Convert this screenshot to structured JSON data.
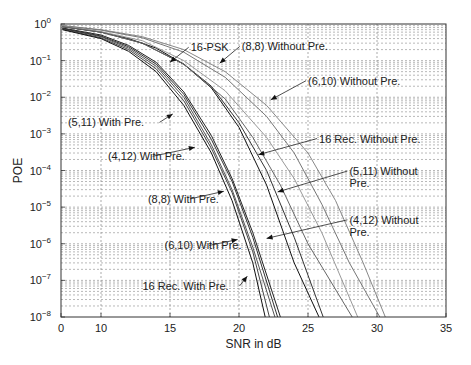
{
  "chart_data": {
    "type": "line",
    "title": "",
    "xlabel": "SNR in dB",
    "ylabel": "POE",
    "xlim": [
      0,
      35
    ],
    "x_ticks": [
      0,
      10,
      15,
      20,
      25,
      30,
      35
    ],
    "x_tick_labels": [
      "0",
      "10",
      "15",
      "20",
      "25",
      "30",
      "35"
    ],
    "yscale": "log",
    "ylim": [
      1e-08,
      1
    ],
    "y_ticks": [
      1,
      0.1,
      0.01,
      0.001,
      0.0001,
      1e-05,
      1e-06,
      1e-07,
      1e-08
    ],
    "y_tick_labels": [
      {
        "base": "10",
        "exp": "0"
      },
      {
        "base": "10",
        "exp": "−1"
      },
      {
        "base": "10",
        "exp": "−2"
      },
      {
        "base": "10",
        "exp": "−3"
      },
      {
        "base": "10",
        "exp": "−4"
      },
      {
        "base": "10",
        "exp": "−5"
      },
      {
        "base": "10",
        "exp": "−6"
      },
      {
        "base": "10",
        "exp": "−7"
      },
      {
        "base": "10",
        "exp": "−8"
      }
    ],
    "grid": true,
    "legend": "none",
    "series": [
      {
        "name": "16-PSK",
        "color": "#111111",
        "x": [
          7.2,
          10,
          12,
          14,
          16,
          18,
          20,
          22,
          24,
          25.8
        ],
        "y": [
          0.85,
          0.6,
          0.4,
          0.22,
          0.08,
          0.018,
          0.0015,
          4e-05,
          3e-07,
          1e-08
        ]
      },
      {
        "name": "(8,8) Without Pre.",
        "color": "#888888",
        "x": [
          7.2,
          10,
          13,
          16,
          19,
          22,
          25,
          27,
          29,
          30.6
        ],
        "y": [
          0.9,
          0.7,
          0.45,
          0.2,
          0.05,
          0.006,
          0.0003,
          1.5e-05,
          3e-07,
          1e-08
        ]
      },
      {
        "name": "(6,10) Without Pre.",
        "color": "#777777",
        "x": [
          7.2,
          10,
          13,
          16,
          19,
          22,
          24,
          26,
          28,
          30.2
        ],
        "y": [
          0.9,
          0.68,
          0.42,
          0.17,
          0.035,
          0.003,
          0.0003,
          1.2e-05,
          3e-07,
          1e-08
        ]
      },
      {
        "name": "16 Rec. Without Pre.",
        "color": "#333333",
        "x": [
          7.2,
          10,
          13,
          16,
          18,
          20,
          22,
          24,
          26.1
        ],
        "y": [
          0.85,
          0.6,
          0.3,
          0.08,
          0.02,
          0.002,
          0.0001,
          1.5e-06,
          1e-08
        ]
      },
      {
        "name": "(5,11) Without Pre.",
        "color": "#999999",
        "x": [
          7.2,
          10,
          13,
          16,
          19,
          22,
          24,
          26,
          28.6
        ],
        "y": [
          0.88,
          0.62,
          0.35,
          0.1,
          0.015,
          0.0008,
          6e-05,
          2e-06,
          1e-08
        ]
      },
      {
        "name": "(4,12) Without Pre.",
        "color": "#666666",
        "x": [
          7.2,
          10,
          13,
          16,
          19,
          21,
          23,
          25,
          28.2
        ],
        "y": [
          0.85,
          0.6,
          0.3,
          0.08,
          0.009,
          0.0008,
          4e-05,
          1e-06,
          1e-08
        ]
      },
      {
        "name": "(5,11) With Pre.",
        "color": "#555555",
        "x": [
          7.2,
          10,
          12,
          14,
          16,
          18,
          19.5,
          21,
          22.6
        ],
        "y": [
          0.75,
          0.45,
          0.22,
          0.07,
          0.01,
          0.0005,
          3e-05,
          8e-07,
          1e-08
        ]
      },
      {
        "name": "(4,12) With Pre.",
        "color": "#444444",
        "x": [
          7.2,
          10,
          12,
          14,
          16,
          18,
          19.5,
          21,
          22.2
        ],
        "y": [
          0.72,
          0.42,
          0.2,
          0.06,
          0.008,
          0.0004,
          2.5e-05,
          6e-07,
          1e-08
        ]
      },
      {
        "name": "(8,8) With Pre.",
        "color": "#222222",
        "x": [
          7.2,
          10,
          12,
          14,
          16,
          18,
          19.5,
          21,
          23.0
        ],
        "y": [
          0.78,
          0.5,
          0.26,
          0.09,
          0.014,
          0.0009,
          6e-05,
          2e-06,
          1e-08
        ]
      },
      {
        "name": "(6,10) With Pre.",
        "color": "#333333",
        "x": [
          7.2,
          10,
          12,
          14,
          16,
          18,
          19.5,
          21,
          22.8
        ],
        "y": [
          0.76,
          0.47,
          0.24,
          0.08,
          0.012,
          0.0007,
          5e-05,
          1.5e-06,
          1e-08
        ]
      },
      {
        "name": "16 Rec. With Pre.",
        "color": "#111111",
        "x": [
          7.2,
          10,
          12,
          14,
          16,
          18,
          19.5,
          21,
          21.9
        ],
        "y": [
          0.7,
          0.4,
          0.18,
          0.05,
          0.006,
          0.0003,
          1.5e-05,
          3e-07,
          1e-08
        ]
      }
    ],
    "annotations": [
      {
        "text": "16-PSK",
        "target_series": "16-PSK",
        "text_at": [
          16.5,
          0.18
        ],
        "arrow_to": [
          15.0,
          0.09
        ]
      },
      {
        "text": "(8,8) Without Pre.",
        "text_at": [
          20.2,
          0.19
        ],
        "arrow_to": [
          18.6,
          0.085
        ],
        "target_series": "(8,8) Without Pre."
      },
      {
        "text": "(6,10) Without Pre.",
        "text_at": [
          25.0,
          0.022
        ],
        "arrow_to": [
          22.3,
          0.0085
        ],
        "target_series": "(6,10) Without Pre."
      },
      {
        "text": "(5,11) With Pre.",
        "text_at": [
          7.6,
          0.0016
        ],
        "arrow_to": [
          15.2,
          0.0035
        ],
        "target_series": "(5,11) With Pre."
      },
      {
        "text": "16 Rec. Without Pre.",
        "text_at": [
          25.8,
          0.00058
        ],
        "arrow_to": [
          21.4,
          0.00027
        ],
        "target_series": "16 Rec. Without Pre."
      },
      {
        "text": "(4,12) With Pre.",
        "text_at": [
          10.5,
          0.00019
        ],
        "arrow_to": [
          16.8,
          0.00043
        ],
        "target_series": "(4,12) With Pre."
      },
      {
        "text": "(5,11) Without",
        "text2": "Pre.",
        "text_at": [
          28.0,
          7.5e-05
        ],
        "arrow_to": [
          22.8,
          2.6e-05
        ],
        "target_series": "(5,11) Without Pre."
      },
      {
        "text": "(8,8) With Pre.",
        "text_at": [
          13.4,
          1.3e-05
        ],
        "arrow_to": [
          18.9,
          2.7e-05
        ],
        "target_series": "(8,8) With Pre."
      },
      {
        "text": "(4,12) Without",
        "text2": "Pre.",
        "text_at": [
          28.0,
          3.5e-06
        ],
        "arrow_to": [
          22.0,
          1.4e-06
        ],
        "target_series": "(4,12) Without Pre."
      },
      {
        "text": "(6,10) With Pre.",
        "text_at": [
          14.6,
          7e-07
        ],
        "arrow_to": [
          19.9,
          1.3e-06
        ],
        "target_series": "(6,10) With Pre."
      },
      {
        "text": "16 Rec. With Pre.",
        "text_at": [
          13.0,
          5.5e-08
        ],
        "arrow_to": [
          20.6,
          1.3e-07
        ],
        "target_series": "16 Rec. With Pre."
      }
    ]
  }
}
